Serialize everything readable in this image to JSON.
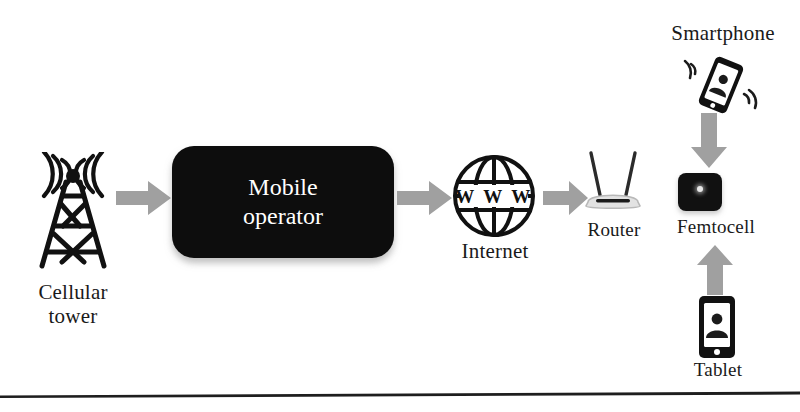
{
  "diagram": {
    "background_color": "#ffffff",
    "accent_dark": "#0d0d0d",
    "arrow_color": "#9a9a9a",
    "nodes": [
      {
        "id": "cellular-tower",
        "label": "Cellular\ntower",
        "icon": "cellular-tower-icon",
        "style": "line-art"
      },
      {
        "id": "mobile-operator",
        "label": "Mobile\noperator",
        "icon": "rounded-box",
        "style": "filled-dark",
        "text_color": "#ffffff",
        "fill_color": "#0d0d0d"
      },
      {
        "id": "internet",
        "label": "Internet",
        "icon": "globe-icon",
        "inner_text": "W W W",
        "style": "line-art"
      },
      {
        "id": "router",
        "label": "Router",
        "icon": "router-icon",
        "style": "line-art"
      },
      {
        "id": "femtocell",
        "label": "Femtocell",
        "icon": "femtocell-icon",
        "style": "filled-dark",
        "fill_color": "#111111"
      },
      {
        "id": "smartphone",
        "label": "Smartphone",
        "icon": "smartphone-icon",
        "style": "line-art",
        "tilted": true
      },
      {
        "id": "tablet",
        "label": "Tablet",
        "icon": "tablet-icon",
        "style": "line-art"
      }
    ],
    "arrows": [
      {
        "id": "tower-to-operator",
        "from": "cellular-tower",
        "to": "mobile-operator",
        "direction": "right"
      },
      {
        "id": "operator-to-internet",
        "from": "mobile-operator",
        "to": "internet",
        "direction": "right"
      },
      {
        "id": "internet-to-router",
        "from": "internet",
        "to": "router",
        "direction": "right"
      },
      {
        "id": "smartphone-to-femtocell",
        "from": "smartphone",
        "to": "femtocell",
        "direction": "down"
      },
      {
        "id": "tablet-to-femtocell",
        "from": "tablet",
        "to": "femtocell",
        "direction": "up"
      }
    ],
    "labels": {
      "cellular_tower": "Cellular\ntower",
      "mobile_operator": "Mobile\noperator",
      "internet": "Internet",
      "internet_globe_text": "W W W",
      "router": "Router",
      "femtocell": "Femtocell",
      "smartphone": "Smartphone",
      "tablet": "Tablet"
    }
  }
}
